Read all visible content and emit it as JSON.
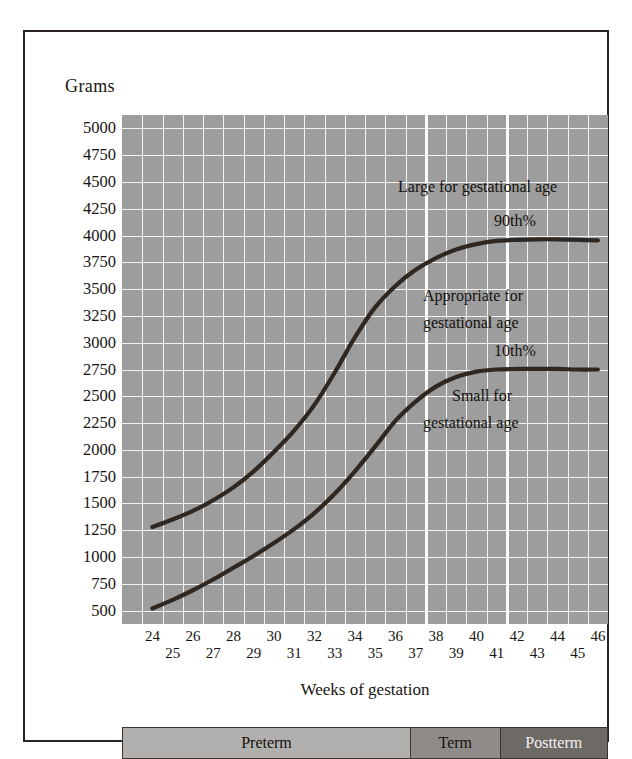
{
  "chart_data": {
    "type": "line",
    "title": "",
    "xlabel": "Weeks of gestation",
    "ylabel": "Grams",
    "xlim": [
      23,
      47
    ],
    "ylim": [
      375,
      5125
    ],
    "grid": true,
    "legend": "none",
    "x_ticks": [
      24,
      25,
      26,
      27,
      28,
      29,
      30,
      31,
      32,
      33,
      34,
      35,
      36,
      37,
      38,
      39,
      40,
      41,
      42,
      43,
      44,
      45,
      46
    ],
    "y_ticks": [
      500,
      750,
      1000,
      1250,
      1500,
      1750,
      2000,
      2250,
      2500,
      2750,
      3000,
      3250,
      3500,
      3750,
      4000,
      4250,
      4500,
      4750,
      5000
    ],
    "major_x_separators": [
      38,
      42
    ],
    "series": [
      {
        "name": "90th%",
        "x": [
          24,
          25,
          26,
          27,
          28,
          29,
          30,
          31,
          32,
          33,
          34,
          35,
          36,
          37,
          38,
          39,
          40,
          41,
          42,
          43,
          44,
          45,
          46
        ],
        "values": [
          1280,
          1350,
          1430,
          1530,
          1650,
          1800,
          1980,
          2180,
          2420,
          2720,
          3050,
          3330,
          3530,
          3680,
          3790,
          3870,
          3920,
          3950,
          3960,
          3965,
          3965,
          3960,
          3955
        ]
      },
      {
        "name": "10th%",
        "x": [
          24,
          25,
          26,
          27,
          28,
          29,
          30,
          31,
          32,
          33,
          34,
          35,
          36,
          37,
          38,
          39,
          40,
          41,
          42,
          43,
          44,
          45,
          46
        ],
        "values": [
          520,
          600,
          690,
          790,
          900,
          1010,
          1130,
          1260,
          1410,
          1590,
          1800,
          2030,
          2270,
          2450,
          2590,
          2680,
          2730,
          2750,
          2755,
          2755,
          2755,
          2750,
          2750
        ]
      }
    ],
    "annotations": [
      {
        "id": "large-for-gestational-age",
        "text": "Large for gestational age"
      },
      {
        "id": "percentile-90",
        "text": "90th%"
      },
      {
        "id": "appropriate-line1",
        "text": "Appropriate for"
      },
      {
        "id": "appropriate-line2",
        "text": "gestational age"
      },
      {
        "id": "percentile-10",
        "text": "10th%"
      },
      {
        "id": "small-line1",
        "text": "Small for"
      },
      {
        "id": "small-line2",
        "text": "gestational age"
      }
    ],
    "colors": {
      "plot_background": "#9d9d9d",
      "gridline": "#f2f2f2",
      "curve": "#2e2722",
      "frame": "#2b2622"
    }
  },
  "term_bar": {
    "segments": [
      {
        "label": "Preterm",
        "color": "#b2b0ae"
      },
      {
        "label": "Term",
        "color": "#8e8b88"
      },
      {
        "label": "Postterm",
        "color": "#6d6a66"
      }
    ]
  }
}
